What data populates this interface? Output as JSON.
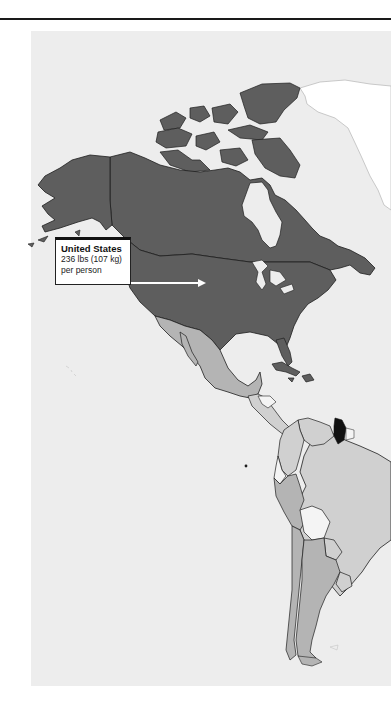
{
  "map": {
    "title": "",
    "region": "The Americas",
    "colors": {
      "ocean": "#ededed",
      "very_high": "#5e5e5e",
      "high": "#b4b4b4",
      "medium": "#d0d0d0",
      "low": "#f4f4f4",
      "highlight": "#111111",
      "greenland_no_data": "#ffffff",
      "border": "#1e1e1e"
    },
    "callout": {
      "country": "United States",
      "value_line": "236 lbs (107 kg)",
      "unit_line": "per person"
    },
    "regions": [
      {
        "name": "United States",
        "shade": "very_high"
      },
      {
        "name": "Canada",
        "shade": "very_high"
      },
      {
        "name": "Mexico",
        "shade": "high"
      },
      {
        "name": "Central America",
        "shade": "medium"
      },
      {
        "name": "Cuba",
        "shade": "very_high"
      },
      {
        "name": "Hispaniola",
        "shade": "very_high"
      },
      {
        "name": "Venezuela",
        "shade": "medium"
      },
      {
        "name": "Colombia",
        "shade": "medium"
      },
      {
        "name": "Ecuador",
        "shade": "low"
      },
      {
        "name": "Peru",
        "shade": "high"
      },
      {
        "name": "Brazil",
        "shade": "medium"
      },
      {
        "name": "Bolivia",
        "shade": "low"
      },
      {
        "name": "Paraguay",
        "shade": "medium"
      },
      {
        "name": "Chile",
        "shade": "high"
      },
      {
        "name": "Argentina",
        "shade": "high"
      },
      {
        "name": "Uruguay",
        "shade": "medium"
      },
      {
        "name": "Guyana",
        "shade": "highlight"
      },
      {
        "name": "Suriname",
        "shade": "low"
      },
      {
        "name": "Greenland",
        "shade": "greenland_no_data"
      }
    ]
  }
}
